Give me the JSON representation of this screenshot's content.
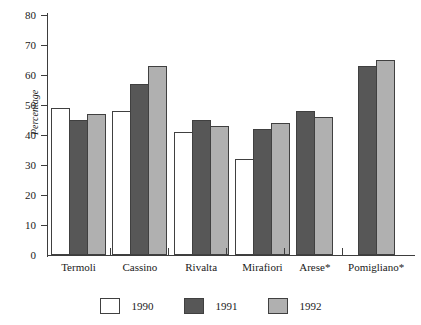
{
  "chart_data": {
    "type": "bar",
    "title": "",
    "xlabel": "",
    "ylabel": "Percentage",
    "ylim": [
      0,
      80
    ],
    "ytick_values": [
      0,
      10,
      20,
      30,
      40,
      50,
      60,
      70,
      80
    ],
    "ytick_labels": [
      "0",
      "10",
      "20",
      "30",
      "40",
      "50",
      "60",
      "70",
      "80"
    ],
    "grid": false,
    "legend_position": "bottom-center",
    "categories": [
      "Termoli",
      "Cassino",
      "Rivalta",
      "Mirafiori",
      "Arese*",
      "Pomigliano*"
    ],
    "series": [
      {
        "name": "1990",
        "color": "#ffffff",
        "values": [
          49,
          48,
          41,
          32,
          null,
          null
        ]
      },
      {
        "name": "1991",
        "color": "#575757",
        "values": [
          45,
          57,
          45,
          42,
          48,
          63
        ]
      },
      {
        "name": "1992",
        "color": "#b0b0b0",
        "values": [
          47,
          63,
          43,
          44,
          46,
          65
        ]
      }
    ]
  },
  "axis": {
    "y_title": "Percentage",
    "tick_labels": [
      "80",
      "70",
      "60",
      "50",
      "40",
      "30",
      "20",
      "10",
      "0"
    ]
  },
  "categories": [
    {
      "label": "Termoli"
    },
    {
      "label": "Cassino"
    },
    {
      "label": "Rivalta"
    },
    {
      "label": "Mirafiori"
    },
    {
      "label": "Arese*"
    },
    {
      "label": "Pomigliano*"
    }
  ],
  "legend": {
    "items": [
      {
        "label": "1990",
        "color": "#ffffff"
      },
      {
        "label": "1991",
        "color": "#575757"
      },
      {
        "label": "1992",
        "color": "#b0b0b0"
      }
    ]
  },
  "title_remnant": ""
}
